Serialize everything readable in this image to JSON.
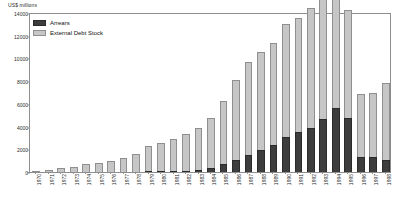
{
  "chart_data": {
    "type": "bar",
    "stacked": true,
    "title": "",
    "subtitle": "",
    "xlabel": "",
    "ylabel": "US$ millions",
    "ylim": [
      0,
      14000
    ],
    "ytick_values": [
      0,
      2000,
      4000,
      6000,
      8000,
      10000,
      12000,
      14000
    ],
    "ytick_labels": [
      "0",
      "2000",
      "4000",
      "6000",
      "8000",
      "10000",
      "12000",
      "14000"
    ],
    "grid": false,
    "legend_position": "top-left",
    "categories": [
      "1970",
      "1971",
      "1972",
      "1973",
      "1974",
      "1975",
      "1976",
      "1977",
      "1978",
      "1979",
      "1980",
      "1981",
      "1982",
      "1983",
      "1984",
      "1985",
      "1986",
      "1987",
      "1988",
      "1989",
      "1990",
      "1991",
      "1992",
      "1993",
      "1994",
      "1995",
      "1996",
      "1997",
      "1998"
    ],
    "series": [
      {
        "name": "Arrears",
        "color": "#3d3d3d",
        "values": [
          0,
          0,
          0,
          0,
          0,
          0,
          0,
          0,
          20,
          40,
          60,
          90,
          130,
          200,
          360,
          700,
          1100,
          1500,
          1900,
          2400,
          3100,
          3500,
          3900,
          4700,
          5600,
          4750,
          1350,
          1350,
          1100
        ]
      },
      {
        "name": "External Debt Stock",
        "color": "#c6c6c6",
        "values": [
          120,
          210,
          330,
          420,
          740,
          820,
          980,
          1270,
          1560,
          2180,
          2500,
          2800,
          3200,
          3700,
          4400,
          5550,
          7000,
          8150,
          8700,
          9000,
          9900,
          10100,
          10500,
          10900,
          12100,
          9500,
          5550,
          5650,
          6750
        ]
      }
    ]
  },
  "legend": {
    "items": [
      {
        "label": "Arrears",
        "swatch": "arrears"
      },
      {
        "label": "External Debt Stock",
        "swatch": "stock"
      }
    ]
  },
  "axis": {
    "unit_label": "US$ millions"
  }
}
